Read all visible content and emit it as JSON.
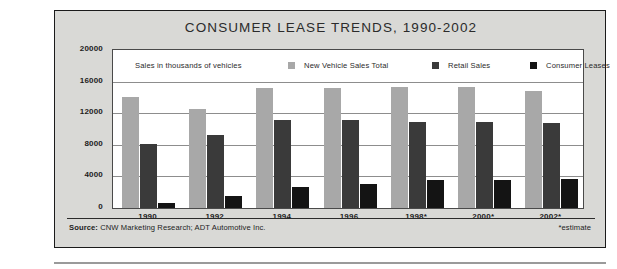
{
  "chart_data": {
    "type": "bar",
    "title": "CONSUMER LEASE TRENDS, 1990-2002",
    "xlabel": "",
    "ylabel": "Sales in thousands of vehicles",
    "ylim": [
      0,
      20000
    ],
    "yticks": [
      20000,
      16000,
      12000,
      8000,
      4000,
      0
    ],
    "grid": true,
    "legend_position": "top-inside",
    "categories": [
      "1990",
      "1992",
      "1994",
      "1996",
      "1998*",
      "2000*",
      "2002*"
    ],
    "series": [
      {
        "name": "New Vehicle Sales Total",
        "color": "#a8a8a8",
        "values": [
          14000,
          12500,
          15200,
          15200,
          15300,
          15300,
          14800
        ]
      },
      {
        "name": "Retail Sales",
        "color": "#3a3a3a",
        "values": [
          8100,
          9200,
          11100,
          11100,
          10900,
          10900,
          10800
        ]
      },
      {
        "name": "Consumer Leases",
        "color": "#141414",
        "values": [
          600,
          1500,
          2600,
          3000,
          3500,
          3500,
          3650
        ]
      }
    ],
    "annotations": {
      "axis_note": "Sales in thousands of vehicles",
      "estimate_note": "*estimate",
      "source_label": "Source:",
      "source_text": "CNW Marketing Research; ADT Automotive Inc."
    }
  },
  "colors": {
    "panel_background": "#d9d9d6",
    "plot_background": "#ffffff",
    "frame": "#1b1b1b",
    "gridline": "#8d8d8d",
    "text": "#1c1c1c"
  }
}
